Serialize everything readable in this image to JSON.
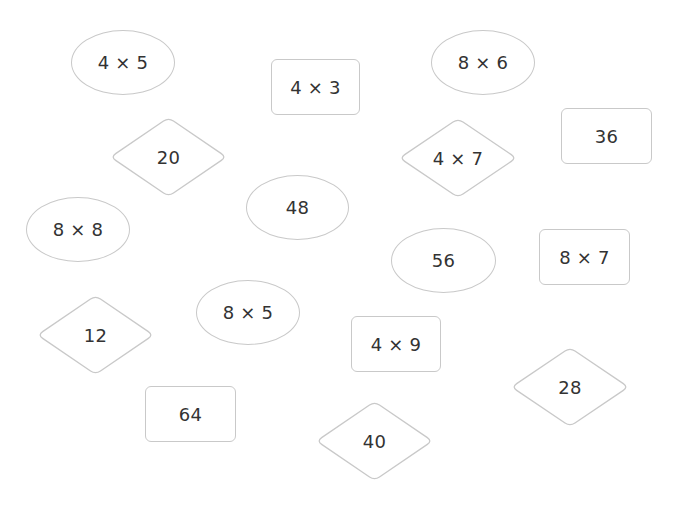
{
  "colors": {
    "background": "#ffffff",
    "border": "#c9c9c9",
    "text": "#333333"
  },
  "cards": [
    {
      "id": "c1",
      "shape": "ellipse",
      "label": "4 × 5",
      "x": 71,
      "y": 30,
      "w": 104,
      "h": 65
    },
    {
      "id": "c2",
      "shape": "rect",
      "label": "4 × 3",
      "x": 271,
      "y": 59,
      "w": 89,
      "h": 56
    },
    {
      "id": "c3",
      "shape": "ellipse",
      "label": "8 × 6",
      "x": 431,
      "y": 30,
      "w": 104,
      "h": 65
    },
    {
      "id": "c4",
      "shape": "diamond",
      "label": "20",
      "x": 110,
      "y": 117,
      "w": 117,
      "h": 80
    },
    {
      "id": "c5",
      "shape": "diamond",
      "label": "4 × 7",
      "x": 399,
      "y": 118,
      "w": 118,
      "h": 80
    },
    {
      "id": "c6",
      "shape": "rect",
      "label": "36",
      "x": 561,
      "y": 108,
      "w": 91,
      "h": 56
    },
    {
      "id": "c7",
      "shape": "ellipse",
      "label": "48",
      "x": 246,
      "y": 175,
      "w": 103,
      "h": 65
    },
    {
      "id": "c8",
      "shape": "ellipse",
      "label": "8 × 8",
      "x": 26,
      "y": 197,
      "w": 104,
      "h": 65
    },
    {
      "id": "c9",
      "shape": "ellipse",
      "label": "56",
      "x": 391,
      "y": 228,
      "w": 105,
      "h": 65
    },
    {
      "id": "c10",
      "shape": "rect",
      "label": "8 × 7",
      "x": 539,
      "y": 229,
      "w": 91,
      "h": 56
    },
    {
      "id": "c11",
      "shape": "diamond",
      "label": "12",
      "x": 37,
      "y": 295,
      "w": 117,
      "h": 80
    },
    {
      "id": "c12",
      "shape": "ellipse",
      "label": "8 × 5",
      "x": 196,
      "y": 280,
      "w": 104,
      "h": 65
    },
    {
      "id": "c13",
      "shape": "rect",
      "label": "4 × 9",
      "x": 351,
      "y": 316,
      "w": 90,
      "h": 56
    },
    {
      "id": "c14",
      "shape": "diamond",
      "label": "28",
      "x": 511,
      "y": 347,
      "w": 118,
      "h": 80
    },
    {
      "id": "c15",
      "shape": "rect",
      "label": "64",
      "x": 145,
      "y": 386,
      "w": 91,
      "h": 56
    },
    {
      "id": "c16",
      "shape": "diamond",
      "label": "40",
      "x": 316,
      "y": 401,
      "w": 117,
      "h": 80
    }
  ]
}
